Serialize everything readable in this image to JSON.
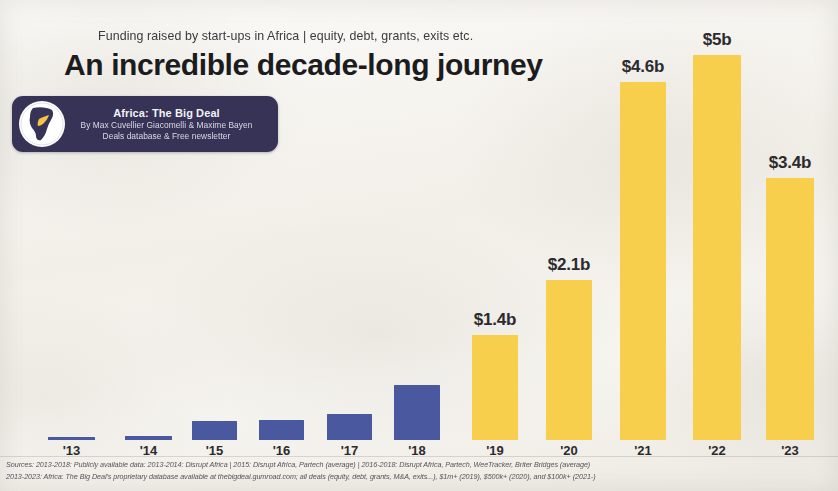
{
  "header": {
    "subtitle": "Funding raised by start-ups in Africa | equity, debt, grants, exits etc.",
    "headline": "An incredible decade-long journey"
  },
  "badge": {
    "logo_icon": "africa-globe-icon",
    "title": "Africa: The Big Deal",
    "authors": "By Max Cuvellier Giacomelli & Maxime Bayen",
    "tagline": "Deals database & Free newsletter",
    "background_color": "#363357"
  },
  "colors": {
    "bar_blue": "#4a58a0",
    "bar_yellow": "#f8cf4d",
    "paper": "#f4f2ee",
    "text_dark": "#1c1c1e"
  },
  "sources": {
    "line1": "Sources: 2013-2018: Publicly available data: 2013-2014: Disrupt Africa | 2015: Disrupt Africa, Partech (average) | 2016-2018: Disrupt Africa, Partech, WeeTracker, Briter Bridges (average)",
    "line2": "2013-2023: Africa: The Big Deal's proprietary database available at thebigdeal.gumroad.com; all deals (equity, debt, grants, M&A, exits...), $1m+ (2019), $500k+ (2020), and $100k+ (2021-)"
  },
  "chart_data": {
    "type": "bar",
    "title": "An incredible decade-long journey",
    "subtitle": "Funding raised by start-ups in Africa | equity, debt, grants, exits etc.",
    "xlabel": "",
    "ylabel": "Funding raised (US$ billions)",
    "ylim": [
      0,
      5.0
    ],
    "grid": false,
    "legend": false,
    "categories": [
      "'13",
      "'14",
      "'15",
      "'16",
      "'17",
      "'18",
      "'19",
      "'20",
      "'21",
      "'22",
      "'23"
    ],
    "values": [
      0.02,
      0.03,
      0.19,
      0.2,
      0.27,
      0.42,
      1.4,
      2.1,
      4.6,
      5.0,
      3.4
    ],
    "value_labels": [
      "",
      "",
      "",
      "",
      "",
      "",
      "$1.4b",
      "$2.1b",
      "$4.6b",
      "$5b",
      "$3.4b"
    ],
    "bar_colors": [
      "#4a58a0",
      "#4a58a0",
      "#4a58a0",
      "#4a58a0",
      "#4a58a0",
      "#4a58a0",
      "#f8cf4d",
      "#f8cf4d",
      "#f8cf4d",
      "#f8cf4d",
      "#f8cf4d"
    ],
    "bars": [
      {
        "category": "'13",
        "value": 0.02,
        "label": "",
        "color": "#4a58a0",
        "x": 48,
        "width": 47,
        "height": 3
      },
      {
        "category": "'14",
        "value": 0.03,
        "label": "",
        "color": "#4a58a0",
        "x": 125,
        "width": 47,
        "height": 4
      },
      {
        "category": "'15",
        "value": 0.19,
        "label": "",
        "color": "#4a58a0",
        "x": 192,
        "width": 45,
        "height": 19
      },
      {
        "category": "'16",
        "value": 0.2,
        "label": "",
        "color": "#4a58a0",
        "x": 259,
        "width": 45,
        "height": 20
      },
      {
        "category": "'17",
        "value": 0.27,
        "label": "",
        "color": "#4a58a0",
        "x": 327,
        "width": 45,
        "height": 26
      },
      {
        "category": "'18",
        "value": 0.42,
        "label": "",
        "color": "#4a58a0",
        "x": 394,
        "width": 46,
        "height": 55
      },
      {
        "category": "'19",
        "value": 1.4,
        "label": "$1.4b",
        "color": "#f8cf4d",
        "x": 472,
        "width": 46,
        "height": 105
      },
      {
        "category": "'20",
        "value": 2.1,
        "label": "$2.1b",
        "color": "#f8cf4d",
        "x": 546,
        "width": 46,
        "height": 160
      },
      {
        "category": "'21",
        "value": 4.6,
        "label": "$4.6b",
        "color": "#f8cf4d",
        "x": 620,
        "width": 46,
        "height": 358
      },
      {
        "category": "'22",
        "value": 5.0,
        "label": "$5b",
        "color": "#f8cf4d",
        "x": 693,
        "width": 48,
        "height": 385
      },
      {
        "category": "'23",
        "value": 3.4,
        "label": "$3.4b",
        "color": "#f8cf4d",
        "x": 766,
        "width": 48,
        "height": 262
      }
    ],
    "baseline_y": 440,
    "source_note": "Sources: 2013-2018 publicly available data; 2019-2023 Africa: The Big Deal proprietary database"
  }
}
